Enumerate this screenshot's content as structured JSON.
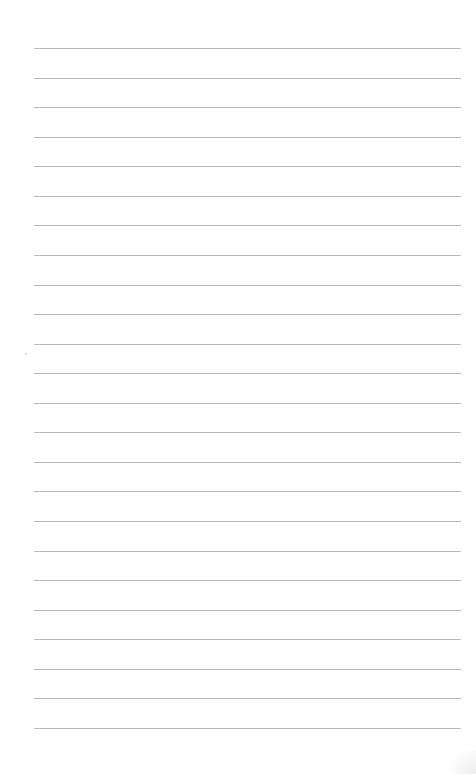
{
  "page": {
    "type": "lined-paper",
    "background_color": "#fefefe",
    "rule_color": "#b9b9b9",
    "rule_count": 24,
    "first_rule_y": 48,
    "rule_spacing": 29.565,
    "rule_left": 34,
    "rule_right": 461,
    "text_lines": []
  }
}
